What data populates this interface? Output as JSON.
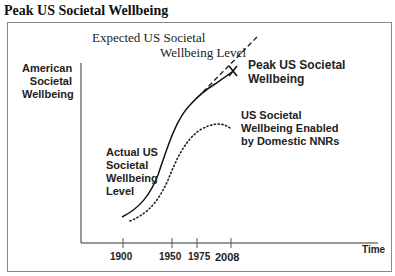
{
  "title": "Peak US Societal Wellbeing",
  "y_axis_label": [
    "American",
    "Societal",
    "Wellbeing"
  ],
  "x_axis_label": "Time",
  "x_ticks": [
    "1900",
    "1950",
    "1975",
    "2008"
  ],
  "annotations": {
    "expected": [
      "Expected US Societal",
      "Wellbeing Level"
    ],
    "peak": [
      "Peak US Societal",
      "Wellbeing"
    ],
    "peak_marker": "X",
    "actual": [
      "Actual US",
      "Societal",
      "Wellbeing",
      "Level"
    ],
    "domestic": [
      "US Societal",
      "Wellbeing Enabled",
      "by Domestic NNRs"
    ]
  },
  "series": [
    {
      "name": "Actual US Societal Wellbeing Level",
      "style": "solid"
    },
    {
      "name": "Expected US Societal Wellbeing Level",
      "style": "dashed"
    },
    {
      "name": "US Societal Wellbeing Enabled by Domestic NNRs",
      "style": "dotted"
    }
  ]
}
